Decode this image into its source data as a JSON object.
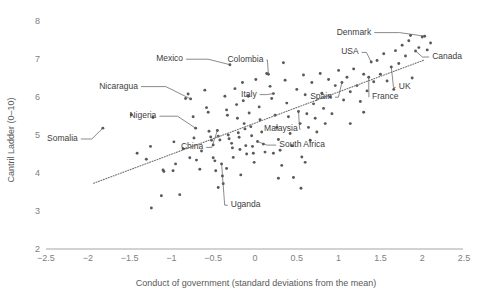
{
  "chart_data": {
    "type": "scatter",
    "title": "",
    "xlabel": "Conduct of government (standard deviations from the mean)",
    "ylabel": "Cantril Ladder (0–10)",
    "xlim": [
      -2.5,
      2.5
    ],
    "ylim": [
      2,
      8
    ],
    "xticks": [
      "−2.5",
      "−2",
      "−1.5",
      "−1",
      "−0.5",
      "0",
      "0.5",
      "1",
      "1.5",
      "2",
      "2.5"
    ],
    "xtick_values": [
      -2.5,
      -2,
      -1.5,
      -1,
      -0.5,
      0,
      0.5,
      1,
      1.5,
      2,
      2.5
    ],
    "yticks": [
      "8",
      "7",
      "6",
      "5",
      "4",
      "3",
      "2"
    ],
    "ytick_values": [
      8,
      7,
      6,
      5,
      4,
      3,
      2
    ],
    "grid": false,
    "legend": false,
    "trendline": {
      "type": "linear",
      "x0": -1.93,
      "y0": 3.73,
      "x1": 2.02,
      "y1": 6.97
    },
    "annotations": [
      {
        "label": "Somalia",
        "x": -1.82,
        "y": 5.18,
        "lx": -2.12,
        "ly": 4.92
      },
      {
        "label": "Nicaragua",
        "x": -0.77,
        "y": 5.95,
        "lx": -1.4,
        "ly": 6.3
      },
      {
        "label": "Mexico",
        "x": -0.3,
        "y": 6.85,
        "lx": -0.86,
        "ly": 7.02
      },
      {
        "label": "Nigeria",
        "x": -0.71,
        "y": 5.18,
        "lx": -1.18,
        "ly": 5.52
      },
      {
        "label": "Colombia",
        "x": 0.16,
        "y": 6.6,
        "lx": 0.1,
        "ly": 7.0
      },
      {
        "label": "Italy",
        "x": 0.22,
        "y": 6.09,
        "lx": 0.02,
        "ly": 6.09
      },
      {
        "label": "China",
        "x": -0.45,
        "y": 5.12,
        "lx": -0.62,
        "ly": 4.7
      },
      {
        "label": "Malaysia",
        "x": 0.52,
        "y": 5.62,
        "lx": 0.51,
        "ly": 5.18
      },
      {
        "label": "South Africa",
        "x": 0.03,
        "y": 4.83,
        "lx": 0.29,
        "ly": 4.76
      },
      {
        "label": "Uganda",
        "x": -0.4,
        "y": 4.24,
        "lx": -0.29,
        "ly": 3.18
      },
      {
        "label": "Spain",
        "x": 1.04,
        "y": 6.38,
        "lx": 0.92,
        "ly": 6.02
      },
      {
        "label": "France",
        "x": 1.36,
        "y": 6.52,
        "lx": 1.4,
        "ly": 6.02
      },
      {
        "label": "UK",
        "x": 1.63,
        "y": 6.79,
        "lx": 1.72,
        "ly": 6.28
      },
      {
        "label": "USA",
        "x": 1.39,
        "y": 6.92,
        "lx": 1.24,
        "ly": 7.2
      },
      {
        "label": "Denmark",
        "x": 2.03,
        "y": 7.6,
        "lx": 1.39,
        "ly": 7.72
      },
      {
        "label": "Canada",
        "x": 1.92,
        "y": 7.21,
        "lx": 2.12,
        "ly": 7.08
      }
    ],
    "points": [
      [
        -1.82,
        5.18
      ],
      [
        -1.48,
        5.53
      ],
      [
        -1.22,
        5.46
      ],
      [
        -1.3,
        4.36
      ],
      [
        -1.41,
        4.52
      ],
      [
        -1.25,
        4.7
      ],
      [
        -1.1,
        4.08
      ],
      [
        -1.09,
        4.04
      ],
      [
        -1.12,
        3.4
      ],
      [
        -1.24,
        3.08
      ],
      [
        -0.97,
        4.82
      ],
      [
        -0.95,
        4.24
      ],
      [
        -0.98,
        4.06
      ],
      [
        -0.9,
        3.43
      ],
      [
        -0.86,
        4.64
      ],
      [
        -0.83,
        5.96
      ],
      [
        -0.8,
        6.08
      ],
      [
        -0.77,
        5.95
      ],
      [
        -0.74,
        5.48
      ],
      [
        -0.71,
        5.18
      ],
      [
        -0.73,
        4.92
      ],
      [
        -0.78,
        4.4
      ],
      [
        -0.7,
        4.34
      ],
      [
        -0.66,
        4.1
      ],
      [
        -0.64,
        4.58
      ],
      [
        -0.6,
        6.18
      ],
      [
        -0.58,
        5.72
      ],
      [
        -0.56,
        5.6
      ],
      [
        -0.55,
        5.1
      ],
      [
        -0.53,
        4.95
      ],
      [
        -0.52,
        4.86
      ],
      [
        -0.5,
        4.74
      ],
      [
        -0.5,
        4.4
      ],
      [
        -0.48,
        4.32
      ],
      [
        -0.47,
        4.06
      ],
      [
        -0.45,
        5.12
      ],
      [
        -0.44,
        4.97
      ],
      [
        -0.42,
        4.87
      ],
      [
        -0.4,
        4.24
      ],
      [
        -0.39,
        3.92
      ],
      [
        -0.38,
        3.72
      ],
      [
        -0.36,
        6.02
      ],
      [
        -0.34,
        5.66
      ],
      [
        -0.33,
        5.52
      ],
      [
        -0.32,
        5.0
      ],
      [
        -0.31,
        4.9
      ],
      [
        -0.3,
        6.85
      ],
      [
        -0.28,
        4.78
      ],
      [
        -0.27,
        4.66
      ],
      [
        -0.26,
        4.41
      ],
      [
        -0.24,
        6.22
      ],
      [
        -0.22,
        5.8
      ],
      [
        -0.21,
        5.44
      ],
      [
        -0.2,
        5.06
      ],
      [
        -0.19,
        4.94
      ],
      [
        -0.18,
        4.62
      ],
      [
        -0.17,
        3.95
      ],
      [
        -0.15,
        6.38
      ],
      [
        -0.14,
        5.9
      ],
      [
        -0.13,
        5.3
      ],
      [
        -0.12,
        5.16
      ],
      [
        -0.11,
        4.72
      ],
      [
        -0.1,
        4.5
      ],
      [
        -0.08,
        6.02
      ],
      [
        -0.07,
        5.58
      ],
      [
        -0.05,
        5.22
      ],
      [
        -0.04,
        4.98
      ],
      [
        -0.03,
        4.7
      ],
      [
        -0.02,
        4.52
      ],
      [
        -0.01,
        4.28
      ],
      [
        0.01,
        6.46
      ],
      [
        0.03,
        4.83
      ],
      [
        0.05,
        5.74
      ],
      [
        0.06,
        5.4
      ],
      [
        0.08,
        5.08
      ],
      [
        0.1,
        4.76
      ],
      [
        0.12,
        4.55
      ],
      [
        0.14,
        6.62
      ],
      [
        0.16,
        6.6
      ],
      [
        0.18,
        6.28
      ],
      [
        0.2,
        5.96
      ],
      [
        0.22,
        6.09
      ],
      [
        0.24,
        5.52
      ],
      [
        0.26,
        5.2
      ],
      [
        0.28,
        4.88
      ],
      [
        0.3,
        4.6
      ],
      [
        0.32,
        4.2
      ],
      [
        0.34,
        6.9
      ],
      [
        0.36,
        6.44
      ],
      [
        0.38,
        5.84
      ],
      [
        0.4,
        5.48
      ],
      [
        0.42,
        5.04
      ],
      [
        0.44,
        4.72
      ],
      [
        0.46,
        3.88
      ],
      [
        0.5,
        6.2
      ],
      [
        0.52,
        5.62
      ],
      [
        0.54,
        5.3
      ],
      [
        0.56,
        4.42
      ],
      [
        0.58,
        6.58
      ],
      [
        0.6,
        6.06
      ],
      [
        0.62,
        5.56
      ],
      [
        0.64,
        5.2
      ],
      [
        0.66,
        4.86
      ],
      [
        0.68,
        6.38
      ],
      [
        0.7,
        5.82
      ],
      [
        0.72,
        5.44
      ],
      [
        0.74,
        5.08
      ],
      [
        0.78,
        6.62
      ],
      [
        0.8,
        6.1
      ],
      [
        0.82,
        5.7
      ],
      [
        0.84,
        5.3
      ],
      [
        0.88,
        6.46
      ],
      [
        0.9,
        6.0
      ],
      [
        0.92,
        5.56
      ],
      [
        0.96,
        6.3
      ],
      [
        1.0,
        6.7
      ],
      [
        1.04,
        6.38
      ],
      [
        1.06,
        5.92
      ],
      [
        1.1,
        6.52
      ],
      [
        1.14,
        6.14
      ],
      [
        1.18,
        6.74
      ],
      [
        1.22,
        6.3
      ],
      [
        1.26,
        5.88
      ],
      [
        1.3,
        6.6
      ],
      [
        1.34,
        6.16
      ],
      [
        1.36,
        6.52
      ],
      [
        1.39,
        6.92
      ],
      [
        1.42,
        6.4
      ],
      [
        1.46,
        6.96
      ],
      [
        1.5,
        6.6
      ],
      [
        1.54,
        7.14
      ],
      [
        1.58,
        6.42
      ],
      [
        1.63,
        6.79
      ],
      [
        1.68,
        7.22
      ],
      [
        1.72,
        6.88
      ],
      [
        1.76,
        7.36
      ],
      [
        1.8,
        7.08
      ],
      [
        1.84,
        7.48
      ],
      [
        1.88,
        6.5
      ],
      [
        1.92,
        7.21
      ],
      [
        1.96,
        7.3
      ],
      [
        2.0,
        7.58
      ],
      [
        2.03,
        7.6
      ],
      [
        2.06,
        7.24
      ],
      [
        2.1,
        7.42
      ],
      [
        1.14,
        5.3
      ],
      [
        0.6,
        4.28
      ],
      [
        0.28,
        3.86
      ],
      [
        0.55,
        3.6
      ],
      [
        0.22,
        4.52
      ],
      [
        -0.34,
        4.12
      ],
      [
        -0.44,
        3.62
      ],
      [
        1.86,
        7.62
      ],
      [
        1.66,
        6.2
      ],
      [
        1.3,
        5.6
      ]
    ]
  }
}
